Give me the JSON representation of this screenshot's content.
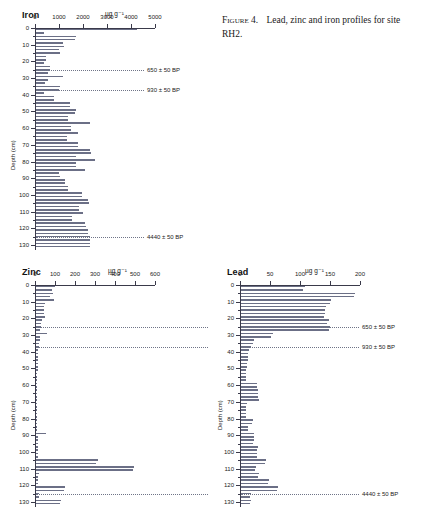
{
  "caption": {
    "label": "Figure 4.",
    "text": "Lead, zinc and iron profiles for site RH2."
  },
  "axis_unit": "µg g⁻¹",
  "depth_axis_label": "Depth (cm)",
  "panels": [
    {
      "id": "iron",
      "title": "Iron",
      "unit": "µg g⁻¹",
      "xlabel": "",
      "ylabel": "Depth (cm)",
      "xticks": [
        0,
        1000,
        2000,
        3000,
        4000,
        5000
      ],
      "xlim": [
        0,
        5000
      ],
      "ylim": [
        0,
        133
      ],
      "yticks": [
        0,
        10,
        20,
        30,
        40,
        50,
        60,
        70,
        80,
        90,
        100,
        110,
        120,
        130
      ],
      "datum_lines": [
        {
          "depth": 25,
          "label": "650 ± 50 BP"
        },
        {
          "depth": 37,
          "label": "930 ± 50 BP"
        },
        {
          "depth": 125,
          "label": "4440 ± 50 BP"
        }
      ],
      "depths": [
        1,
        3,
        5,
        7,
        9,
        11,
        13,
        15,
        17,
        19,
        21,
        23,
        25,
        27,
        29,
        31,
        33,
        35,
        37,
        39,
        41,
        43,
        45,
        47,
        49,
        51,
        53,
        55,
        57,
        59,
        61,
        63,
        65,
        67,
        69,
        71,
        73,
        75,
        77,
        79,
        81,
        83,
        85,
        87,
        89,
        91,
        93,
        95,
        97,
        99,
        101,
        103,
        105,
        107,
        109,
        111,
        113,
        115,
        117,
        119,
        121,
        123,
        125,
        127,
        129,
        131
      ],
      "values": [
        4220,
        330,
        1680,
        1640,
        1140,
        1150,
        960,
        1000,
        420,
        430,
        340,
        580,
        600,
        480,
        1140,
        480,
        370,
        980,
        960,
        330,
        760,
        770,
        1420,
        1430,
        1650,
        1640,
        1330,
        1340,
        2230,
        1450,
        1460,
        1760,
        1300,
        1310,
        1760,
        1740,
        2260,
        2280,
        1680,
        2460,
        1660,
        1680,
        2040,
        970,
        980,
        1190,
        1200,
        1320,
        1330,
        1900,
        1910,
        2180,
        2190,
        1790,
        1800,
        1960,
        1500,
        1510,
        2060,
        2070,
        2150,
        2160,
        2250,
        2270,
        2240,
        2250
      ]
    },
    {
      "id": "zinc",
      "title": "Zinc",
      "unit": "µg g⁻¹",
      "xlabel": "",
      "ylabel": "Depth (cm)",
      "xticks": [
        0,
        100,
        200,
        300,
        400,
        500,
        600
      ],
      "xlim": [
        0,
        600
      ],
      "ylim": [
        0,
        133
      ],
      "yticks": [
        0,
        10,
        20,
        30,
        40,
        50,
        60,
        70,
        80,
        90,
        100,
        110,
        120,
        130
      ],
      "datum_lines": [
        {
          "depth": 25,
          "label": ""
        },
        {
          "depth": 37,
          "label": ""
        },
        {
          "depth": 125,
          "label": ""
        }
      ],
      "depths": [
        1,
        3,
        5,
        7,
        9,
        11,
        13,
        15,
        17,
        19,
        21,
        23,
        25,
        27,
        29,
        31,
        33,
        35,
        37,
        39,
        41,
        43,
        45,
        47,
        49,
        51,
        53,
        55,
        57,
        59,
        61,
        63,
        65,
        67,
        69,
        71,
        73,
        75,
        77,
        79,
        81,
        83,
        85,
        87,
        89,
        91,
        93,
        95,
        97,
        99,
        101,
        103,
        105,
        107,
        109,
        111,
        113,
        115,
        117,
        119,
        121,
        123,
        125,
        127,
        129,
        131
      ],
      "values": [
        96,
        78,
        84,
        70,
        92,
        44,
        40,
        38,
        42,
        46,
        28,
        24,
        26,
        22,
        54,
        20,
        18,
        16,
        14,
        12,
        10,
        9,
        9,
        8,
        8,
        8,
        7,
        7,
        7,
        7,
        7,
        7,
        6,
        6,
        6,
        6,
        6,
        6,
        6,
        6,
        6,
        6,
        6,
        6,
        52,
        8,
        8,
        8,
        8,
        8,
        10,
        12,
        308,
        300,
        490,
        485,
        14,
        12,
        12,
        12,
        146,
        142,
        14,
        14,
        126,
        120
      ]
    },
    {
      "id": "lead",
      "title": "Lead",
      "unit": "µg g⁻¹",
      "xlabel": "",
      "ylabel": "Depth (cm)",
      "xticks": [
        0,
        50,
        100,
        150,
        200
      ],
      "xlim": [
        0,
        200
      ],
      "ylim": [
        0,
        133
      ],
      "yticks": [
        0,
        10,
        20,
        30,
        40,
        50,
        60,
        70,
        80,
        90,
        100,
        110,
        120,
        130
      ],
      "datum_lines": [
        {
          "depth": 25,
          "label": "650 ± 50 BP"
        },
        {
          "depth": 37,
          "label": "930 ± 50 BP"
        },
        {
          "depth": 125,
          "label": "4440 ± 50 BP"
        }
      ],
      "depths": [
        1,
        3,
        5,
        7,
        9,
        11,
        13,
        15,
        17,
        19,
        21,
        23,
        25,
        27,
        29,
        31,
        33,
        35,
        37,
        39,
        41,
        43,
        45,
        47,
        49,
        51,
        53,
        55,
        57,
        59,
        61,
        63,
        65,
        67,
        69,
        71,
        73,
        75,
        77,
        79,
        81,
        83,
        85,
        87,
        89,
        91,
        93,
        95,
        97,
        99,
        101,
        103,
        105,
        107,
        109,
        111,
        113,
        115,
        117,
        119,
        121,
        123,
        125,
        127,
        129,
        131
      ],
      "values": [
        106,
        104,
        190,
        188,
        150,
        148,
        142,
        140,
        140,
        138,
        146,
        144,
        148,
        146,
        54,
        50,
        22,
        20,
        16,
        14,
        12,
        11,
        11,
        10,
        10,
        9,
        9,
        9,
        9,
        26,
        27,
        28,
        28,
        29,
        30,
        10,
        9,
        9,
        8,
        8,
        20,
        19,
        12,
        11,
        22,
        21,
        21,
        20,
        28,
        27,
        27,
        26,
        42,
        40,
        25,
        24,
        30,
        29,
        46,
        45,
        62,
        60,
        16,
        15,
        16,
        15
      ]
    }
  ]
}
